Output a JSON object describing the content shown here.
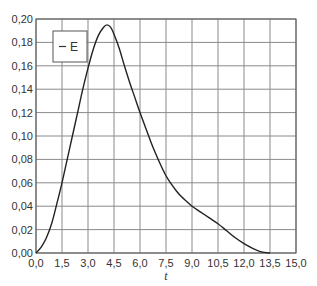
{
  "chart_data": {
    "type": "line",
    "title": "",
    "xlabel": "t",
    "ylabel": "",
    "xlim": [
      0.0,
      15.0
    ],
    "ylim": [
      0.0,
      0.2
    ],
    "grid": true,
    "legend_position": "upper-left",
    "x_ticks": [
      "0,0",
      "1,5",
      "3,0",
      "4,5",
      "6,0",
      "7,5",
      "9,0",
      "10,5",
      "12,0",
      "13,5",
      "15,0"
    ],
    "y_ticks": [
      "0,00",
      "0,02",
      "0,04",
      "0,06",
      "0,08",
      "0,10",
      "0,12",
      "0,14",
      "0,16",
      "0,18",
      "0,20"
    ],
    "series": [
      {
        "name": "E",
        "color": "#222222",
        "x": [
          0.0,
          0.3,
          0.6,
          0.9,
          1.2,
          1.5,
          1.8,
          2.1,
          2.4,
          2.7,
          3.0,
          3.3,
          3.6,
          3.9,
          4.1,
          4.3,
          4.5,
          4.8,
          5.1,
          5.4,
          5.7,
          6.0,
          6.3,
          6.6,
          6.9,
          7.2,
          7.5,
          7.8,
          8.1,
          8.4,
          8.7,
          9.0,
          9.5,
          10.0,
          10.5,
          11.0,
          11.5,
          12.0,
          12.5,
          13.0,
          13.5
        ],
        "values": [
          0.0,
          0.005,
          0.013,
          0.025,
          0.042,
          0.06,
          0.08,
          0.1,
          0.12,
          0.14,
          0.158,
          0.174,
          0.186,
          0.193,
          0.195,
          0.193,
          0.187,
          0.175,
          0.16,
          0.146,
          0.133,
          0.12,
          0.108,
          0.096,
          0.085,
          0.075,
          0.066,
          0.059,
          0.053,
          0.048,
          0.044,
          0.04,
          0.035,
          0.03,
          0.025,
          0.019,
          0.013,
          0.008,
          0.004,
          0.001,
          0.0
        ]
      }
    ]
  },
  "legend": {
    "items": [
      {
        "label": "E",
        "symbol": "—"
      }
    ]
  },
  "axes": {
    "x_title": "t"
  }
}
